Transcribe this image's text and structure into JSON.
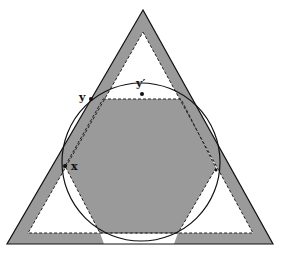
{
  "figure": {
    "type": "geometric-diagram",
    "colors": {
      "background": "#ffffff",
      "fill_gray": "#9a9a9a",
      "stroke": "#111111"
    },
    "shapes": {
      "outer_triangle": {
        "points": [
          [
            143,
            10
          ],
          [
            7,
            244
          ],
          [
            273,
            244
          ]
        ]
      },
      "inner_dashed_triangle": {
        "points": [
          [
            143,
            32
          ],
          [
            28,
            233
          ],
          [
            253,
            233
          ]
        ]
      },
      "circle": {
        "cx": 141,
        "cy": 162,
        "r": 79
      },
      "hexagon": {
        "points": [
          [
            103,
            99
          ],
          [
            181,
            99
          ],
          [
            216,
            168
          ],
          [
            178,
            233
          ],
          [
            100,
            233
          ],
          [
            65,
            166
          ]
        ]
      }
    },
    "points": [
      {
        "id": "y",
        "label": "y",
        "x": 91,
        "y": 99,
        "label_x": 79,
        "label_y": 98
      },
      {
        "id": "y_prime",
        "label": "y′",
        "x": 142,
        "y": 94,
        "label_x": 136,
        "label_y": 85
      },
      {
        "id": "x",
        "label": "x",
        "x": 65,
        "y": 166,
        "label_x": 71,
        "label_y": 170
      },
      {
        "id": "right_contact",
        "label": "",
        "x": 216,
        "y": 170
      }
    ]
  }
}
